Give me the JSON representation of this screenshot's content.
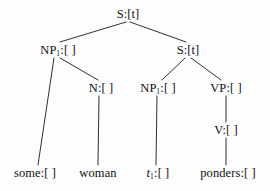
{
  "figure": {
    "kind": "syntax-tree",
    "background_color": "#fdfdfd",
    "line_color": "#1a1a1a",
    "text_color": "#111111"
  },
  "nodes": {
    "root_s": {
      "label": "S:[t]",
      "base": "S",
      "sub": "",
      "feature": ":[t]",
      "x": 128,
      "y": 14
    },
    "np1_subject": {
      "label": "NP1:[ ]",
      "base": "NP",
      "sub": "1",
      "feature": ":[ ]",
      "x": 58,
      "y": 50
    },
    "embedded_s": {
      "label": "S:[t]",
      "base": "S",
      "sub": "",
      "feature": ":[t]",
      "x": 188,
      "y": 50
    },
    "n_noun": {
      "label": "N:[ ]",
      "base": "N",
      "sub": "",
      "feature": ":[ ]",
      "x": 101,
      "y": 88
    },
    "np1_trace_parent": {
      "label": "NP1:[ ]",
      "base": "NP",
      "sub": "1",
      "feature": ":[ ]",
      "x": 158,
      "y": 88
    },
    "vp": {
      "label": "VP:[ ]",
      "base": "VP",
      "sub": "",
      "feature": ":[ ]",
      "x": 226,
      "y": 88
    },
    "v": {
      "label": "V:[ ]",
      "base": "V",
      "sub": "",
      "feature": ":[ ]",
      "x": 226,
      "y": 130
    },
    "leaf_some": {
      "label": "some:[ ]",
      "base": "some",
      "sub": "",
      "feature": ":[ ]",
      "x": 35,
      "y": 173
    },
    "leaf_woman": {
      "label": "woman",
      "base": "woman",
      "sub": "",
      "feature": "",
      "x": 98,
      "y": 173
    },
    "leaf_trace": {
      "label": "t1:[ ]",
      "base": "t",
      "sub": "1",
      "feature": ":[ ]",
      "x": 158,
      "y": 173
    },
    "leaf_ponders": {
      "label": "ponders:[ ]",
      "base": "ponders",
      "sub": "",
      "feature": ":[ ]",
      "x": 228,
      "y": 173
    }
  },
  "edges": [
    {
      "from": "root_s",
      "to": "np1_subject",
      "x1": 126,
      "y1": 22,
      "x2": 60,
      "y2": 42
    },
    {
      "from": "root_s",
      "to": "embedded_s",
      "x1": 130,
      "y1": 22,
      "x2": 186,
      "y2": 42
    },
    {
      "from": "np1_subject",
      "to": "leaf_some",
      "x1": 54,
      "y1": 58,
      "x2": 38,
      "y2": 165
    },
    {
      "from": "np1_subject",
      "to": "n_noun",
      "x1": 60,
      "y1": 58,
      "x2": 98,
      "y2": 80
    },
    {
      "from": "n_noun",
      "to": "leaf_woman",
      "x1": 99,
      "y1": 96,
      "x2": 98,
      "y2": 165
    },
    {
      "from": "embedded_s",
      "to": "np1_trace_parent",
      "x1": 185,
      "y1": 58,
      "x2": 162,
      "y2": 80
    },
    {
      "from": "embedded_s",
      "to": "vp",
      "x1": 191,
      "y1": 58,
      "x2": 221,
      "y2": 80
    },
    {
      "from": "np1_trace_parent",
      "to": "leaf_trace",
      "x1": 157,
      "y1": 96,
      "x2": 156,
      "y2": 165
    },
    {
      "from": "vp",
      "to": "v",
      "x1": 226,
      "y1": 96,
      "x2": 226,
      "y2": 122
    },
    {
      "from": "v",
      "to": "leaf_ponders",
      "x1": 226,
      "y1": 138,
      "x2": 226,
      "y2": 165
    }
  ]
}
